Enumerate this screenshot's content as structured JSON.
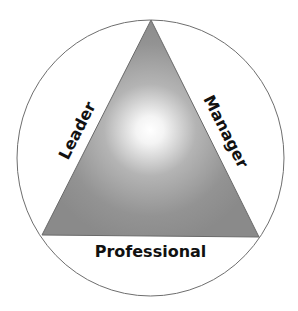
{
  "diagram": {
    "type": "triangle-in-circle",
    "labels": {
      "left_side": "Leader",
      "right_side": "Manager",
      "bottom_side": "Professional"
    },
    "colors": {
      "circle_stroke": "#6e6e6e",
      "triangle_fill_edge": "#8a8a8a",
      "triangle_fill_center": "#ffffff",
      "triangle_stroke": "#6a6a6a",
      "text": "#111111",
      "background": "#ffffff"
    }
  }
}
